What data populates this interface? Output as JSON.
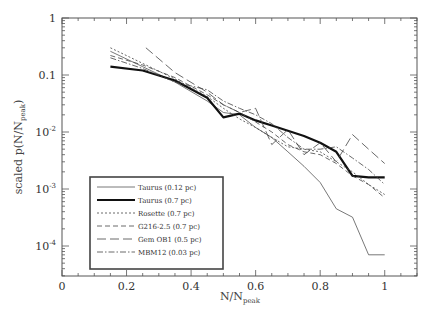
{
  "chart_data": {
    "type": "line",
    "title": "",
    "xlabel": "N/N_peak",
    "xlabel_main": "N/N",
    "xlabel_sub": "peak",
    "ylabel": "scaled p(N/N_peak)",
    "ylabel_main": "scaled p(N/N",
    "ylabel_sub": "peak",
    "ylabel_close": ")",
    "xlim": [
      0,
      1.1
    ],
    "ylim": [
      2.8e-05,
      1
    ],
    "yscale": "log",
    "grid": false,
    "legend_position": "lower left",
    "x_ticks": [
      {
        "value": 0,
        "label": "0"
      },
      {
        "value": 0.2,
        "label": "0.2"
      },
      {
        "value": 0.4,
        "label": "0.4"
      },
      {
        "value": 0.6,
        "label": "0.6"
      },
      {
        "value": 0.8,
        "label": "0.8"
      },
      {
        "value": 1,
        "label": "1"
      }
    ],
    "y_ticks": [
      {
        "value": 1,
        "label": "1",
        "exp": ""
      },
      {
        "value": 0.1,
        "label": "0.1",
        "exp": ""
      },
      {
        "value": 0.01,
        "label": "10",
        "exp": "-2"
      },
      {
        "value": 0.001,
        "label": "10",
        "exp": "-3"
      },
      {
        "value": 0.0001,
        "label": "10",
        "exp": "-4"
      }
    ],
    "series": [
      {
        "name": "Taurus (0.12 pc)",
        "style": "thin-solid",
        "x": [
          0.15,
          0.25,
          0.35,
          0.45,
          0.5,
          0.55,
          0.6,
          0.65,
          0.7,
          0.75,
          0.8,
          0.85,
          0.9,
          0.95,
          1.0
        ],
        "y": [
          0.26,
          0.14,
          0.075,
          0.035,
          0.022,
          0.02,
          0.012,
          0.008,
          0.0045,
          0.0025,
          0.0013,
          0.00045,
          0.00032,
          7e-05,
          7e-05
        ]
      },
      {
        "name": "Taurus (0.7 pc)",
        "style": "thick-solid",
        "x": [
          0.15,
          0.25,
          0.35,
          0.45,
          0.5,
          0.55,
          0.6,
          0.65,
          0.7,
          0.75,
          0.8,
          0.85,
          0.9,
          0.95,
          1.0
        ],
        "y": [
          0.14,
          0.12,
          0.08,
          0.04,
          0.018,
          0.021,
          0.016,
          0.013,
          0.0105,
          0.0085,
          0.0065,
          0.0045,
          0.0017,
          0.0016,
          0.0016
        ]
      },
      {
        "name": "Rosette (0.7 pc)",
        "style": "short-dash",
        "x": [
          0.15,
          0.25,
          0.35,
          0.45,
          0.5,
          0.55,
          0.6,
          0.65,
          0.7,
          0.75,
          0.8,
          0.85,
          0.9,
          0.95,
          1.0
        ],
        "y": [
          0.3,
          0.16,
          0.085,
          0.042,
          0.026,
          0.017,
          0.012,
          0.008,
          0.0055,
          0.005,
          0.0045,
          0.003,
          0.002,
          0.0012,
          0.0008
        ]
      },
      {
        "name": "G216-2.5 (0.7 pc)",
        "style": "medium-dash",
        "x": [
          0.15,
          0.25,
          0.35,
          0.45,
          0.5,
          0.55,
          0.6,
          0.65,
          0.7,
          0.75,
          0.8,
          0.85,
          0.9,
          0.95,
          1.0
        ],
        "y": [
          0.22,
          0.15,
          0.09,
          0.045,
          0.03,
          0.022,
          0.015,
          0.01,
          0.006,
          0.0045,
          0.004,
          0.0028,
          0.0017,
          0.0012,
          0.0007
        ]
      },
      {
        "name": "Gem OB1 (0.5 pc)",
        "style": "long-dash",
        "x": [
          0.26,
          0.35,
          0.45,
          0.5,
          0.55,
          0.6,
          0.65,
          0.7,
          0.75,
          0.8,
          0.85,
          0.9,
          0.95,
          1.0
        ],
        "y": [
          0.3,
          0.11,
          0.05,
          0.03,
          0.022,
          0.026,
          0.006,
          0.011,
          0.004,
          0.0065,
          0.003,
          0.009,
          0.005,
          0.0028
        ]
      },
      {
        "name": "MBM12 (0.03 pc)",
        "style": "dash-dot",
        "x": [
          0.15,
          0.25,
          0.35,
          0.45,
          0.5,
          0.55,
          0.6,
          0.65,
          0.7,
          0.75,
          0.8,
          0.85,
          0.9,
          0.95,
          1.0
        ],
        "y": [
          0.2,
          0.13,
          0.075,
          0.055,
          0.035,
          0.026,
          0.02,
          0.014,
          0.008,
          0.005,
          0.005,
          0.0055,
          0.0035,
          0.0022,
          0.0012
        ]
      }
    ]
  },
  "legend": {
    "items": [
      {
        "label": "Taurus (0.12 pc)"
      },
      {
        "label": "Taurus (0.7 pc)"
      },
      {
        "label": "Rosette (0.7 pc)"
      },
      {
        "label": "G216-2.5 (0.7 pc)"
      },
      {
        "label": "Gem OB1 (0.5 pc)"
      },
      {
        "label": "MBM12 (0.03 pc)"
      }
    ]
  }
}
